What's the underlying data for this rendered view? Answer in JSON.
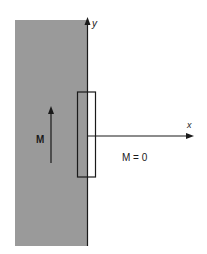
{
  "diagram": {
    "axes": {
      "y_label": "y",
      "x_label": "x"
    },
    "region_left": {
      "label": "M",
      "fill_color": "#9a9a9a",
      "arrow_direction": "up"
    },
    "region_right": {
      "label": "M = 0"
    },
    "boundary_rectangle": {
      "stroke_color": "#1a1a1a"
    }
  }
}
